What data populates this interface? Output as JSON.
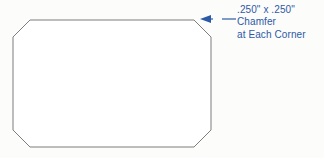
{
  "drawing": {
    "title": "Chamfer Detail",
    "background_color": "#fcfcfb",
    "part": {
      "name": "chamfered-rectangular-plate",
      "outline_color": "#7d7d7d",
      "fill_color": "#ffffff",
      "stroke_width": 1,
      "shape": "octagon",
      "bounds": {
        "left": 13,
        "top": 20,
        "right": 211,
        "bottom": 147
      },
      "chamfer_leg_px": 17,
      "vertices": [
        [
          30,
          20
        ],
        [
          194,
          20
        ],
        [
          211,
          37
        ],
        [
          211,
          130
        ],
        [
          194,
          147
        ],
        [
          30,
          147
        ],
        [
          13,
          130
        ],
        [
          13,
          37
        ]
      ]
    },
    "callout": {
      "name": "chamfer-callout",
      "color": "#2d5aa6",
      "leader": {
        "tail_x": 236,
        "tail_y": 19,
        "tip_x": 200,
        "tip_y": 19,
        "arrow_direction": "left",
        "arrow_length": 11,
        "arrow_half_width": 4,
        "gap_start_x": 213,
        "gap_end_x": 222
      },
      "text_lines": [
        ".250\" x .250\"",
        "Chamfer",
        "at Each Corner"
      ],
      "dimension_value": ".250\"",
      "dimension_second_value": ".250\"",
      "feature_name": "Chamfer",
      "applies_to": "at Each Corner"
    }
  }
}
